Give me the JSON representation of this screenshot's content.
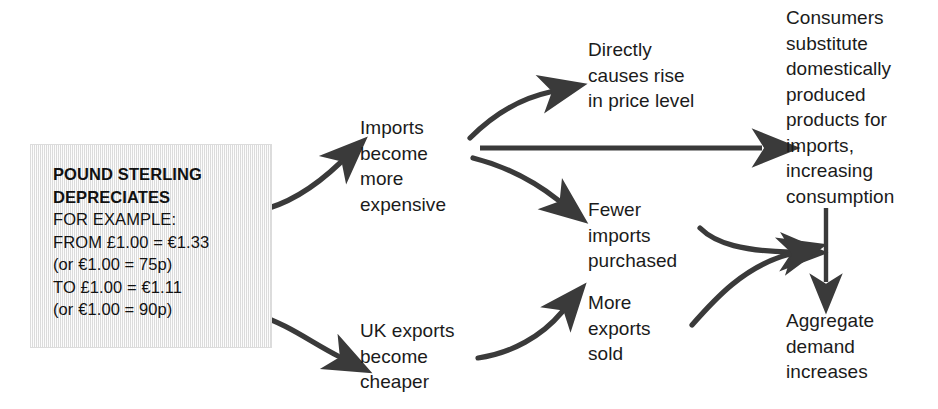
{
  "diagram": {
    "ink_color": "#3a3a3a",
    "box_fill": "#e9e9e9",
    "text_color": "#1b1b1b"
  },
  "source_box": {
    "name": "pound-sterling-depreciates-box",
    "lines": [
      {
        "text": "POUND STERLING",
        "bold": true
      },
      {
        "text": "DEPRECIATES",
        "bold": true
      },
      {
        "text": "FOR EXAMPLE:",
        "bold": false
      },
      {
        "text": "FROM £1.00 = €1.33",
        "bold": false
      },
      {
        "text": "(or €1.00 = 75p)",
        "bold": false
      },
      {
        "text": "TO £1.00 = €1.11",
        "bold": false
      },
      {
        "text": "(or €1.00 = 90p)",
        "bold": false
      }
    ]
  },
  "nodes": {
    "imports_expensive": {
      "name": "imports-become-more-expensive",
      "lines": [
        "Imports",
        "become",
        "more",
        "expensive"
      ]
    },
    "price_level": {
      "name": "directly-causes-rise-in-price-level",
      "lines": [
        "Directly",
        "causes rise",
        "in price level"
      ]
    },
    "consumers_substitute": {
      "name": "consumers-substitute-domestic-products",
      "lines": [
        "Consumers",
        "substitute",
        "domestically",
        "produced",
        "products for",
        "imports,",
        "increasing",
        "consumption"
      ]
    },
    "fewer_imports": {
      "name": "fewer-imports-purchased",
      "lines": [
        "Fewer",
        "imports",
        "purchased"
      ]
    },
    "more_exports": {
      "name": "more-exports-sold",
      "lines": [
        "More",
        "exports",
        "sold"
      ]
    },
    "uk_exports_cheaper": {
      "name": "uk-exports-become-cheaper",
      "lines": [
        "UK exports",
        "become",
        "cheaper"
      ]
    },
    "aggregate_demand": {
      "name": "aggregate-demand-increases",
      "lines": [
        "Aggregate",
        "demand",
        "increases"
      ]
    }
  },
  "arrows": [
    {
      "name": "arrow-box-to-imports",
      "from": "pound-sterling-depreciates-box",
      "to": "imports-become-more-expensive"
    },
    {
      "name": "arrow-box-to-uk-exports",
      "from": "pound-sterling-depreciates-box",
      "to": "uk-exports-become-cheaper"
    },
    {
      "name": "arrow-imports-to-price-level",
      "from": "imports-become-more-expensive",
      "to": "directly-causes-rise-in-price-level"
    },
    {
      "name": "arrow-imports-to-consumers",
      "from": "imports-become-more-expensive",
      "to": "consumers-substitute-domestic-products"
    },
    {
      "name": "arrow-imports-to-fewer-imports",
      "from": "imports-become-more-expensive",
      "to": "fewer-imports-purchased"
    },
    {
      "name": "arrow-uk-exports-to-more-exports",
      "from": "uk-exports-become-cheaper",
      "to": "more-exports-sold"
    },
    {
      "name": "arrow-fewer-imports-to-aggregate",
      "from": "fewer-imports-purchased",
      "to": "aggregate-demand-increases"
    },
    {
      "name": "arrow-more-exports-to-aggregate",
      "from": "more-exports-sold",
      "to": "aggregate-demand-increases"
    },
    {
      "name": "arrow-consumers-to-aggregate",
      "from": "consumers-substitute-domestic-products",
      "to": "aggregate-demand-increases"
    }
  ]
}
